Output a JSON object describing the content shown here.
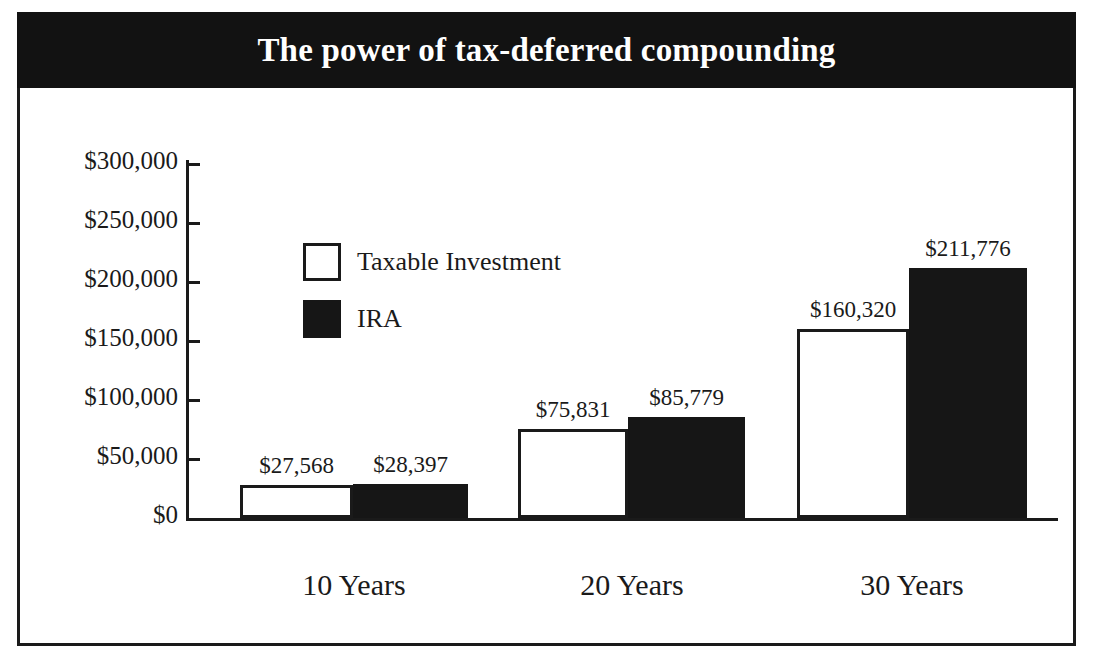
{
  "chart_data": {
    "type": "bar",
    "title": "The power of tax-deferred compounding",
    "subtitle": "",
    "xlabel": "",
    "ylabel": "",
    "categories": [
      "10 Years",
      "20 Years",
      "30 Years"
    ],
    "series": [
      {
        "name": "Taxable Investment",
        "color": "#ffffff",
        "edge_color": "#1a1a1a",
        "values": [
          27568,
          75831,
          160320
        ],
        "value_labels": [
          "$27,568",
          "$75,831",
          "$160,320"
        ]
      },
      {
        "name": "IRA",
        "color": "#161616",
        "edge_color": "#161616",
        "values": [
          28397,
          85779,
          211776
        ],
        "value_labels": [
          "$28,397",
          "$85,779",
          "$211,776"
        ]
      }
    ],
    "ylim": [
      0,
      300000
    ],
    "ytick_values": [
      0,
      50000,
      100000,
      150000,
      200000,
      250000,
      300000
    ],
    "ytick_labels": [
      "$0",
      "$50,000",
      "$100,000",
      "$150,000",
      "$200,000",
      "$250,000",
      "$300,000"
    ],
    "grid": false,
    "legend_position": "upper-left-inside",
    "bar_label_position": "above-bar",
    "annotations": []
  },
  "banner": {
    "background_color": "#121212",
    "text_color": "#ffffff"
  },
  "frame": {
    "border_color": "#1a1a1a"
  }
}
